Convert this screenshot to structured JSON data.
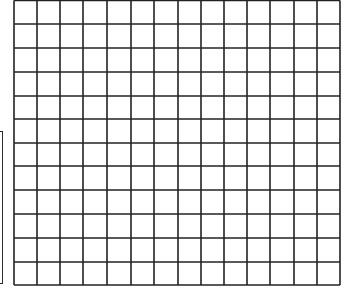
{
  "grid": {
    "columns": 14,
    "rows": 12,
    "x_lines": [
      14,
      37,
      60,
      83,
      107,
      131,
      154,
      178,
      201,
      224,
      247,
      270,
      294,
      317,
      340
    ],
    "y_lines": [
      0.5,
      24,
      48,
      72,
      96,
      119,
      143,
      166,
      190,
      214,
      238,
      262,
      285
    ],
    "line_color": "#222222",
    "cell_fill": "#ffffff"
  },
  "left_panel": {
    "border_color": "#2a2a2a"
  }
}
